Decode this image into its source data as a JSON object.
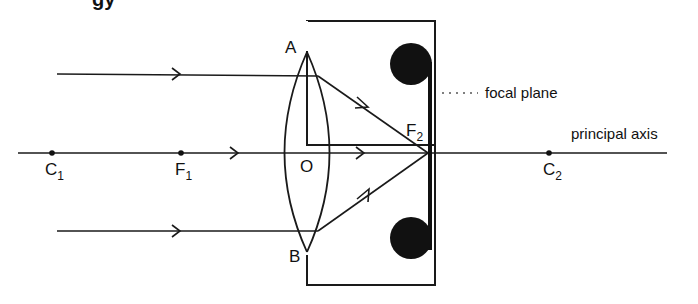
{
  "diagram": {
    "title_fragment": "gy",
    "labels": {
      "A": "A",
      "B": "B",
      "O": "O",
      "C1": "C",
      "C1_sub": "1",
      "F1": "F",
      "F1_sub": "1",
      "F2": "F",
      "F2_sub": "2",
      "C2": "C",
      "C2_sub": "2"
    },
    "annotations": {
      "focal_plane": "focal plane",
      "principal_axis": "principal axis"
    },
    "colors": {
      "line": "#1a1a1a",
      "background": "#ffffff"
    }
  }
}
